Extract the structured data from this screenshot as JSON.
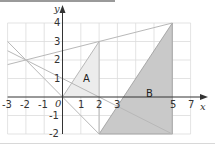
{
  "diagram": {
    "type": "coordinate-grid",
    "x_axis": {
      "label": "x",
      "min": -3,
      "max": 7,
      "ticks": [
        "-3",
        "-2",
        "-1",
        "1",
        "2",
        "3",
        "5",
        "7"
      ]
    },
    "y_axis": {
      "label": "y",
      "min": -2,
      "max": 4,
      "ticks": [
        "4",
        "3",
        "2",
        "1",
        "-1",
        "-2"
      ]
    },
    "origin_label": "0",
    "lines": [
      {
        "name": "y = 0.25x + 2.5",
        "from": [
          -3,
          1.75
        ],
        "to": [
          6,
          4
        ]
      },
      {
        "name": "y = -x",
        "from": [
          -3,
          3
        ],
        "to": [
          2,
          -2
        ]
      },
      {
        "name": "y = -0.5x + 1",
        "from": [
          -3,
          2.5
        ],
        "to": [
          6,
          -2
        ]
      },
      {
        "name": "x = 2",
        "from": [
          2,
          3
        ],
        "to": [
          2,
          -2
        ]
      }
    ],
    "regions": [
      {
        "label": "A",
        "vertices": [
          [
            0,
            0
          ],
          [
            2,
            3
          ],
          [
            2,
            0
          ]
        ],
        "fill": "#ececec"
      },
      {
        "label": "B",
        "vertices": [
          [
            2,
            -2
          ],
          [
            6,
            4
          ],
          [
            6,
            -2
          ]
        ],
        "fill": "#c8c8c8"
      }
    ],
    "colors": {
      "grid": "#d6d6d6",
      "axis": "#333333",
      "line": "#b5b5b5",
      "edge": "#9a9a9a"
    }
  }
}
